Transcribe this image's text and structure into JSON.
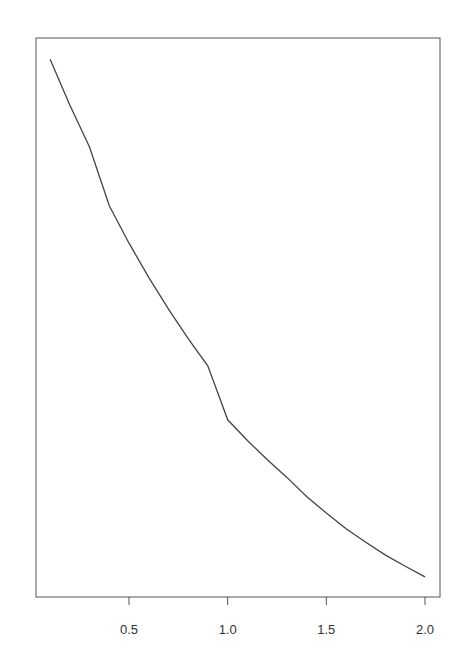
{
  "chart_data": {
    "type": "line",
    "title": "",
    "xlabel": "",
    "ylabel": "",
    "xlim": [
      0.1,
      2.0
    ],
    "x_ticks": [
      0.5,
      1.0,
      1.5,
      2.0
    ],
    "x_tick_labels": [
      "0.5",
      "1.0",
      "1.5",
      "2.0"
    ],
    "y_ticks": [],
    "grid": false,
    "legend": null,
    "series": [
      {
        "name": "curve",
        "color": "#444444",
        "x": [
          0.1,
          0.2,
          0.3,
          0.4,
          0.5,
          0.6,
          0.7,
          0.8,
          0.9,
          1.0,
          1.1,
          1.2,
          1.3,
          1.4,
          1.5,
          1.6,
          1.7,
          1.8,
          1.9,
          2.0
        ],
        "y_relative": [
          0.962,
          0.88,
          0.805,
          0.7,
          0.633,
          0.572,
          0.515,
          0.462,
          0.413,
          0.317,
          0.28,
          0.246,
          0.214,
          0.18,
          0.15,
          0.122,
          0.098,
          0.075,
          0.055,
          0.036
        ]
      }
    ]
  },
  "axes": {
    "x_tick_labels": [
      "0.5",
      "1.0",
      "1.5",
      "2.0"
    ]
  }
}
